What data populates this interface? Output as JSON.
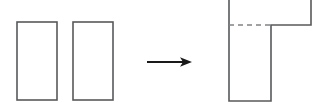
{
  "figure": {
    "canvas": {
      "width": 312,
      "height": 112,
      "background": "#ffffff"
    },
    "stroke": {
      "color": "#58595b",
      "arrow_color": "#1a1a1a",
      "dashed_color": "#808285",
      "width": 1.6,
      "dash_pattern": "5 4"
    },
    "shapes": {
      "left_rectangle": {
        "label": "Rectangle A",
        "x": 17,
        "y": 22,
        "width": 40,
        "height": 78,
        "fill": "none"
      },
      "right_rectangle": {
        "label": "Rectangle B",
        "x": 73,
        "y": 22,
        "width": 40,
        "height": 78,
        "fill": "none"
      },
      "arrow": {
        "label": "transformation arrow",
        "x1": 147,
        "y1": 62,
        "x2": 192,
        "y2": 62,
        "direction": "right"
      },
      "combined_shape": {
        "label": "L-shaped combined region",
        "outline_points": "229,-18 311,-18 311,25 271,25 271,101 229,101",
        "seam_line": {
          "label": "dashed seam where the two rectangles joined",
          "x1": 229,
          "y1": 25,
          "x2": 271,
          "y2": 25,
          "style": "dashed"
        },
        "stem": {
          "x": 229,
          "y": 25,
          "width": 42,
          "height": 76
        },
        "top_bar": {
          "x": 229,
          "y": -18,
          "width": 82,
          "height": 43
        },
        "clipped_top": true
      }
    }
  }
}
